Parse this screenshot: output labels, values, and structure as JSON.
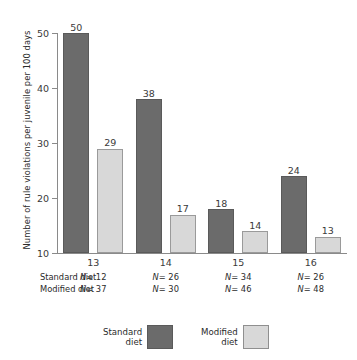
{
  "chart_data": {
    "type": "bar",
    "title": "",
    "xlabel": "",
    "ylabel": "Number of rule violations per juvenile per 100 days",
    "ylim": [
      10,
      50
    ],
    "yticks": [
      10,
      20,
      30,
      40,
      50
    ],
    "grid": false,
    "legend_position": "bottom-center",
    "categories": [
      "13",
      "14",
      "15",
      "16"
    ],
    "series": [
      {
        "name": "Standard diet",
        "color": "#6b6b6b",
        "values": [
          50,
          38,
          18,
          24
        ]
      },
      {
        "name": "Modified diet",
        "color": "#d8d8d8",
        "values": [
          29,
          17,
          14,
          13
        ]
      }
    ],
    "annotations": {
      "sample_size_rows": [
        {
          "label": "Standard diet",
          "values": [
            "N= 12",
            "N= 26",
            "N= 34",
            "N= 26"
          ]
        },
        {
          "label": "Modified diet",
          "values": [
            "N= 37",
            "N= 30",
            "N= 46",
            "N= 48"
          ]
        }
      ]
    }
  },
  "axis": {
    "y_title": "Number of rule violations per juvenile per 100 days",
    "y_tick_labels": [
      "50",
      "40",
      "30",
      "20",
      "10"
    ],
    "x_tick_labels": [
      "13",
      "14",
      "15",
      "16"
    ]
  },
  "bar_labels": {
    "standard": [
      "50",
      "38",
      "18",
      "24"
    ],
    "modified": [
      "29",
      "17",
      "14",
      "13"
    ]
  },
  "ntable": {
    "row0_label": "Standard diet",
    "row1_label": "Modified diet",
    "row0_values": [
      "N= 12",
      "N= 26",
      "N= 34",
      "N= 26"
    ],
    "row1_values": [
      "N= 37",
      "N= 30",
      "N= 46",
      "N= 48"
    ]
  },
  "legend": {
    "items": [
      {
        "label": "Standard\ndiet",
        "color": "#6b6b6b"
      },
      {
        "label": "Modified\ndiet",
        "color": "#d8d8d8"
      }
    ]
  },
  "colors": {
    "standard": "#6b6b6b",
    "modified": "#d8d8d8",
    "axis": "#8a8a8a",
    "text": "#2b2b2b",
    "background": "#ffffff"
  }
}
